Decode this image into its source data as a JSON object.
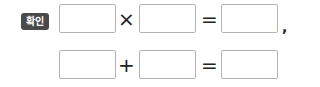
{
  "badge": {
    "label": "확인",
    "color": "#4a4a4a"
  },
  "rows": [
    {
      "operator": "×",
      "equals": "=",
      "trailing": ",",
      "boxes": [
        "",
        "",
        ""
      ]
    },
    {
      "operator": "+",
      "equals": "=",
      "trailing": "",
      "boxes": [
        "",
        "",
        ""
      ]
    }
  ]
}
